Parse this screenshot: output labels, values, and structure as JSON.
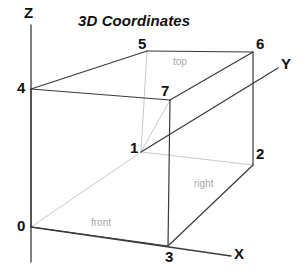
{
  "title": "3D Coordinates",
  "title_pos": {
    "x": 78,
    "y": 13
  },
  "colors": {
    "solid_edge": "#3a3a3a",
    "hidden_edge": "#c9c9c9",
    "axis": "#3a3a3a",
    "text": "#111111",
    "face_label": "#a8a8a8",
    "background": "#ffffff"
  },
  "axes": [
    {
      "name": "z-axis",
      "label": "Z",
      "label_pos": {
        "x": 24,
        "y": 5
      },
      "line": {
        "x1": 31,
        "y1": 25,
        "x2": 31,
        "y2": 262
      },
      "style": "solid"
    },
    {
      "name": "x-axis",
      "label": "X",
      "label_pos": {
        "x": 234,
        "y": 246
      },
      "line": {
        "x1": 31,
        "y1": 227,
        "x2": 231,
        "y2": 256
      },
      "style": "solid"
    },
    {
      "name": "y-axis",
      "label": "Y",
      "label_pos": {
        "x": 281,
        "y": 56
      },
      "line": {
        "x1": 141,
        "y1": 152,
        "x2": 278,
        "y2": 68
      },
      "style": "solid"
    }
  ],
  "vertices": [
    {
      "id": "0",
      "label": "0",
      "x": 31,
      "y": 227,
      "label_pos": {
        "x": 17,
        "y": 218
      }
    },
    {
      "id": "1",
      "label": "1",
      "x": 141,
      "y": 152,
      "label_pos": {
        "x": 130,
        "y": 140
      }
    },
    {
      "id": "2",
      "label": "2",
      "x": 253,
      "y": 165,
      "label_pos": {
        "x": 256,
        "y": 146
      }
    },
    {
      "id": "3",
      "label": "3",
      "x": 168,
      "y": 246,
      "label_pos": {
        "x": 165,
        "y": 249
      }
    },
    {
      "id": "4",
      "label": "4",
      "x": 31,
      "y": 89,
      "label_pos": {
        "x": 17,
        "y": 80
      }
    },
    {
      "id": "5",
      "label": "5",
      "x": 147,
      "y": 51,
      "label_pos": {
        "x": 138,
        "y": 36
      }
    },
    {
      "id": "6",
      "label": "6",
      "x": 253,
      "y": 52,
      "label_pos": {
        "x": 256,
        "y": 36
      }
    },
    {
      "id": "7",
      "label": "7",
      "x": 170,
      "y": 100,
      "label_pos": {
        "x": 161,
        "y": 83
      }
    }
  ],
  "edges": [
    {
      "name": "edge-0-4",
      "from": "0",
      "to": "4",
      "style": "solid"
    },
    {
      "name": "edge-0-3",
      "from": "0",
      "to": "3",
      "style": "solid"
    },
    {
      "name": "edge-3-7",
      "from": "3",
      "to": "7",
      "style": "solid"
    },
    {
      "name": "edge-4-7",
      "from": "4",
      "to": "7",
      "style": "solid"
    },
    {
      "name": "edge-4-5",
      "from": "4",
      "to": "5",
      "style": "solid"
    },
    {
      "name": "edge-5-6",
      "from": "5",
      "to": "6",
      "style": "solid"
    },
    {
      "name": "edge-7-6",
      "from": "7",
      "to": "6",
      "style": "solid"
    },
    {
      "name": "edge-6-2",
      "from": "6",
      "to": "2",
      "style": "solid"
    },
    {
      "name": "edge-3-2",
      "from": "3",
      "to": "2",
      "style": "solid"
    },
    {
      "name": "edge-0-1",
      "from": "0",
      "to": "1",
      "style": "hidden"
    },
    {
      "name": "edge-1-2",
      "from": "1",
      "to": "2",
      "style": "hidden"
    },
    {
      "name": "edge-1-5",
      "from": "1",
      "to": "5",
      "style": "hidden"
    },
    {
      "name": "edge-1-7",
      "from": "1",
      "to": "7",
      "style": "hidden"
    }
  ],
  "face_labels": [
    {
      "name": "face-label-top",
      "text": "top",
      "x": 173,
      "y": 57
    },
    {
      "name": "face-label-right",
      "text": "right",
      "x": 194,
      "y": 179
    },
    {
      "name": "face-label-front",
      "text": "front",
      "x": 91,
      "y": 218
    }
  ]
}
